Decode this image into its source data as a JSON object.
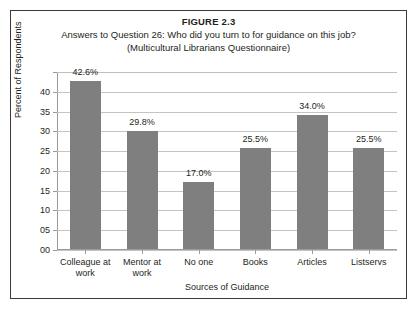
{
  "figure": {
    "title": "FIGURE 2.3",
    "subtitle_line1": "Answers to Question 26: Who did you turn to for guidance on this job?",
    "subtitle_line2": "(Multicultural Librarians Questionnaire)"
  },
  "colors": {
    "bar": "#7f7f7f",
    "gridline": "#c4c4c4",
    "axis": "#9a9a9a",
    "frame": "#3a3a3a",
    "text": "#231f20",
    "background": "#ffffff"
  },
  "chart_data": {
    "type": "bar",
    "title": "FIGURE 2.3",
    "subtitle": "Answers to Question 26: Who did you turn to for guidance on this job? (Multicultural Librarians Questionnaire)",
    "xlabel": "Sources of Guidance",
    "ylabel": "Percent of Respondents",
    "categories": [
      "Colleague at work",
      "Mentor at work",
      "No one",
      "Books",
      "Articles",
      "Listservs"
    ],
    "values": [
      42.6,
      29.8,
      17.0,
      25.5,
      34.0,
      25.5
    ],
    "data_labels": [
      "42.6%",
      "29.8%",
      "17.0%",
      "25.5%",
      "34.0%",
      "25.5%"
    ],
    "ylim": [
      0,
      45
    ],
    "ytick_values": [
      0,
      5,
      10,
      15,
      20,
      25,
      30,
      35,
      40,
      45
    ],
    "ytick_labels": [
      "00",
      "05",
      "10",
      "15",
      "20",
      "25",
      "30",
      "35",
      "40",
      ""
    ],
    "grid": true,
    "legend": false,
    "series": [
      {
        "name": "Percent of Respondents",
        "values": [
          42.6,
          29.8,
          17.0,
          25.5,
          34.0,
          25.5
        ]
      }
    ]
  },
  "categories_wrapped": [
    [
      "Colleague at",
      "work"
    ],
    [
      "Mentor at",
      "work"
    ],
    [
      "No one",
      ""
    ],
    [
      "Books",
      ""
    ],
    [
      "Articles",
      ""
    ],
    [
      "Listservs",
      ""
    ]
  ]
}
